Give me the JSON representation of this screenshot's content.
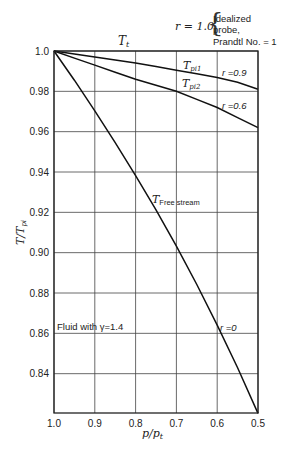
{
  "chart_data": {
    "type": "line",
    "title": "",
    "xlabel": "p/p_t",
    "ylabel": "T/T_pi",
    "xlim": [
      1.0,
      0.5
    ],
    "ylim": [
      0.8205,
      1.0
    ],
    "x_reversed": true,
    "grid": true,
    "x_ticks": [
      "1.0",
      "0.9",
      "0.8",
      "0.7",
      "0.6",
      "0.5"
    ],
    "y_ticks": [
      "1.0",
      "0.98",
      "0.96",
      "0.94",
      "0.92",
      "0.90",
      "0.88",
      "0.86",
      "0.84"
    ],
    "x": [
      1.0,
      0.95,
      0.9,
      0.85,
      0.8,
      0.75,
      0.7,
      0.65,
      0.6,
      0.55,
      0.5
    ],
    "series": [
      {
        "name": "r = 1.0 (T_t, idealized probe)",
        "values": [
          1.0,
          1.0,
          1.0,
          1.0,
          1.0,
          1.0,
          1.0,
          1.0,
          1.0,
          1.0,
          1.0
        ]
      },
      {
        "name": "r = 0.9 (T_pi1)",
        "values": [
          1.0,
          0.9985,
          0.997,
          0.9955,
          0.994,
          0.9923,
          0.9905,
          0.9887,
          0.9868,
          0.9845,
          0.981
        ]
      },
      {
        "name": "r = 0.6 (T_pi2)",
        "values": [
          1.0,
          0.9965,
          0.993,
          0.9895,
          0.986,
          0.983,
          0.98,
          0.976,
          0.972,
          0.967,
          0.962
        ]
      },
      {
        "name": "r = 0 (T_Free stream)",
        "values": [
          1.0,
          0.9855,
          0.9703,
          0.9546,
          0.9382,
          0.9212,
          0.9032,
          0.8842,
          0.8641,
          0.8429,
          0.8203
        ]
      }
    ],
    "annotations": [
      {
        "text": "T_t",
        "near": "top, over x=0.85"
      },
      {
        "text": "r = 1.0",
        "note": "Idealized probe, Prandtl No. = 1"
      },
      {
        "text": "T_pi1",
        "near": "r=0.9 curve"
      },
      {
        "text": "T_pi2",
        "near": "r=0.6 curve"
      },
      {
        "text": "r = 0.9"
      },
      {
        "text": "r = 0.6"
      },
      {
        "text": "T_Free stream",
        "near": "r=0 curve, x≈0.75"
      },
      {
        "text": "r = 0"
      },
      {
        "text": "Fluid with γ = 1.4"
      }
    ]
  },
  "labels": {
    "tt": "T",
    "tt_sub": "t",
    "r10": "r = 1.0",
    "r10_note1": "Idealized",
    "r10_note2": "probe,",
    "r10_note3": "Prandtl No. = 1",
    "tpi1": "T",
    "tpi1_sub": "pi1",
    "tpi2": "T",
    "tpi2_sub": "pi2",
    "r09": "r =0.9",
    "r06": "r =0.6",
    "tfree": "T",
    "tfree_sub": "Free stream",
    "r0": "r =0",
    "fluid": "Fluid with γ=1.4",
    "xlabel_main": "p/p",
    "xlabel_sub": "t",
    "ylabel_main": "T/T",
    "ylabel_sub": "pi"
  }
}
